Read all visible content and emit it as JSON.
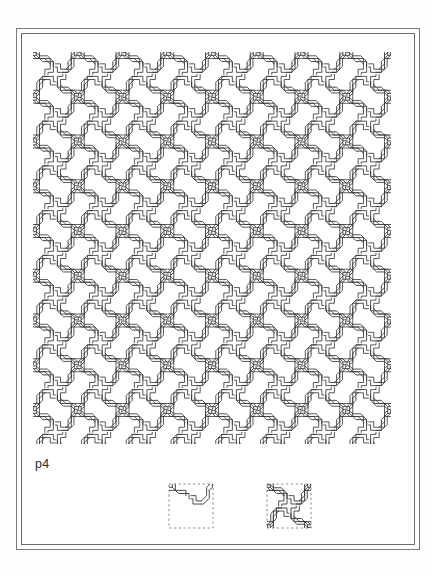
{
  "figure": {
    "caption": "p4",
    "title": "p4",
    "wallpaper_group": "p4",
    "stroke_color": "#3a3a3a",
    "frame_color": "#7b7b7b",
    "background_color": "#ffffff",
    "dash_color": "#6b6b6b"
  },
  "pattern": {
    "name": "interlace-knot-tiling",
    "tile_size_px": 44.75,
    "columns": 8,
    "rows": 9,
    "stroke_width": 0.85,
    "area": {
      "x": 33,
      "y": 52,
      "width": 358,
      "height": 392
    }
  },
  "details": {
    "left": {
      "name": "fundamental-domain-cell",
      "label": "asymmetric unit",
      "dashed": true,
      "size_px": 50
    },
    "right": {
      "name": "unit-cell",
      "label": "unit cell motif",
      "dashed": true,
      "size_px": 50
    }
  },
  "frame": {
    "outer": {
      "x": 16,
      "y": 28,
      "width": 404,
      "height": 522
    },
    "inner": {
      "x": 21,
      "y": 33,
      "width": 394,
      "height": 512
    }
  }
}
